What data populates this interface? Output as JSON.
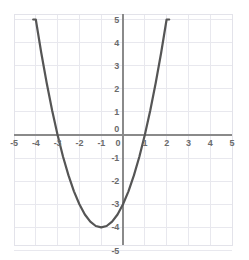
{
  "chart_data": {
    "type": "line",
    "title": "",
    "subtitle": "",
    "xlabel": "",
    "ylabel": "",
    "xlim": [
      -5,
      5
    ],
    "ylim": [
      -5,
      5
    ],
    "grid": true,
    "grid_step": 1,
    "legend": "none",
    "equation": "y = x^2 + 2x - 3",
    "vertex": [
      -1,
      -4
    ],
    "roots": [
      -3,
      1
    ],
    "y_intercept": -3,
    "x_tick_labels": [
      "-5",
      "-4",
      "-3",
      "-2",
      "-1",
      "0",
      "1",
      "2",
      "3",
      "4",
      "5"
    ],
    "y_tick_labels": [
      "5",
      "4",
      "3",
      "2",
      "1",
      "0",
      "-1",
      "-2",
      "-3",
      "-4",
      "-5"
    ],
    "x_ticks": [
      -5,
      -4,
      -3,
      -2,
      -1,
      0,
      1,
      2,
      3,
      4,
      5
    ],
    "y_ticks": [
      5,
      4,
      3,
      2,
      1,
      0,
      -1,
      -2,
      -3,
      -4,
      -5
    ],
    "series": [
      {
        "name": "parabola",
        "x": [
          -4.12,
          -4.0,
          -3.75,
          -3.5,
          -3.25,
          -3.0,
          -2.75,
          -2.5,
          -2.25,
          -2.0,
          -1.75,
          -1.5,
          -1.25,
          -1.0,
          -0.75,
          -0.5,
          -0.25,
          0.0,
          0.25,
          0.5,
          0.75,
          1.0,
          1.25,
          1.5,
          1.75,
          2.0,
          2.12
        ],
        "y": [
          5.0,
          5.0,
          3.56,
          2.25,
          1.06,
          0.0,
          -0.94,
          -1.75,
          -2.44,
          -3.0,
          -3.44,
          -3.75,
          -3.94,
          -4.0,
          -3.94,
          -3.75,
          -3.44,
          -3.0,
          -2.44,
          -1.75,
          -0.94,
          0.0,
          1.06,
          2.25,
          3.56,
          5.0,
          5.0
        ]
      }
    ],
    "colors": {
      "curve": "#555555",
      "axis": "#8a8a8a",
      "grid": "#e8e8ee",
      "border": "#e3e3ea",
      "tick_text": "#6b6b6b",
      "background": "#ffffff"
    },
    "geometry": {
      "plot_left": 14,
      "plot_top": 14,
      "plot_right": 232,
      "plot_bottom": 245,
      "origin_x": 123,
      "origin_y": 135,
      "unit_px_x": 21.8,
      "unit_px_y": 23.1
    }
  }
}
